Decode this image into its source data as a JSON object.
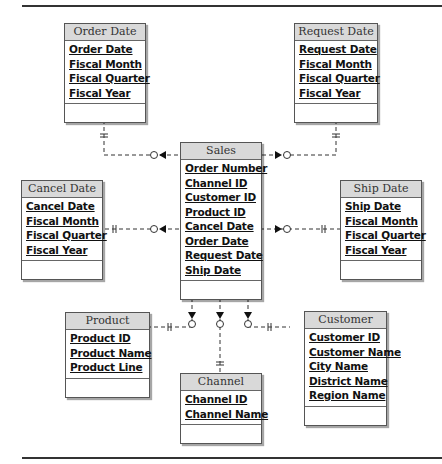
{
  "diagram": {
    "type": "dimensional-model",
    "fact": {
      "name": "Sales",
      "attributes": [
        "Order Number",
        "Channel ID",
        "Customer ID",
        "Product ID",
        "Cancel Date",
        "Order Date",
        "Request Date",
        "Ship Date"
      ]
    },
    "dimensions": [
      {
        "name": "Order Date",
        "attributes": [
          "Order Date",
          "Fiscal Month",
          "Fiscal Quarter",
          "Fiscal Year"
        ]
      },
      {
        "name": "Request Date",
        "attributes": [
          "Request Date",
          "Fiscal Month",
          "Fiscal Quarter",
          "Fiscal Year"
        ]
      },
      {
        "name": "Cancel Date",
        "attributes": [
          "Cancel Date",
          "Fiscal Month",
          "Fiscal Quarter",
          "Fiscal Year"
        ]
      },
      {
        "name": "Ship Date",
        "attributes": [
          "Ship Date",
          "Fiscal Month",
          "Fiscal Quarter",
          "Fiscal Year"
        ]
      },
      {
        "name": "Product",
        "attributes": [
          "Product ID",
          "Product Name",
          "Product Line"
        ]
      },
      {
        "name": "Channel",
        "attributes": [
          "Channel ID",
          "Channel Name"
        ]
      },
      {
        "name": "Customer",
        "attributes": [
          "Customer ID",
          "Customer Name",
          "City Name",
          "District Name",
          "Region Name"
        ]
      }
    ],
    "relationships": [
      {
        "from": "Order Date",
        "to": "Sales",
        "from_cardinality": "one-and-only-one",
        "to_cardinality": "zero-or-many"
      },
      {
        "from": "Request Date",
        "to": "Sales",
        "from_cardinality": "one-and-only-one",
        "to_cardinality": "zero-or-many"
      },
      {
        "from": "Cancel Date",
        "to": "Sales",
        "from_cardinality": "one-and-only-one",
        "to_cardinality": "zero-or-many"
      },
      {
        "from": "Ship Date",
        "to": "Sales",
        "from_cardinality": "one-and-only-one",
        "to_cardinality": "zero-or-many"
      },
      {
        "from": "Product",
        "to": "Sales",
        "from_cardinality": "one-and-only-one",
        "to_cardinality": "zero-or-many"
      },
      {
        "from": "Channel",
        "to": "Sales",
        "from_cardinality": "one-and-only-one",
        "to_cardinality": "zero-or-many"
      },
      {
        "from": "Customer",
        "to": "Sales",
        "from_cardinality": "one-and-only-one",
        "to_cardinality": "zero-or-many"
      }
    ]
  },
  "caption": "FIGURE 10.3   Dimensional data model ... (truncated)"
}
